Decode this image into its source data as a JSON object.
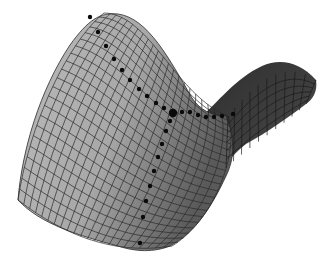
{
  "figure": {
    "colors": {
      "background": "#ffffff",
      "surface_front": "#b4b4b4",
      "surface_mid": "#9a9a9a",
      "surface_back": "#3a3a3a",
      "mesh_line": "#2a2a2a",
      "dots": "#0a0a0a"
    },
    "saddle_point": {
      "x": 173,
      "y": 113,
      "r": 4.2
    },
    "path_upper": [
      [
        90,
        17
      ],
      [
        98,
        32
      ],
      [
        106,
        46
      ],
      [
        114,
        59
      ],
      [
        122,
        70
      ],
      [
        130,
        80
      ],
      [
        139,
        89
      ],
      [
        147,
        96
      ],
      [
        156,
        103
      ],
      [
        164,
        108
      ]
    ],
    "path_right": [
      [
        182,
        112
      ],
      [
        190,
        112
      ],
      [
        198,
        115
      ],
      [
        206,
        117
      ],
      [
        214,
        117
      ],
      [
        222,
        116
      ],
      [
        233,
        114
      ]
    ],
    "path_lower": [
      [
        170,
        121
      ],
      [
        166,
        131
      ],
      [
        162,
        144
      ],
      [
        158,
        157
      ],
      [
        154,
        171
      ],
      [
        150,
        186
      ],
      [
        146,
        201
      ],
      [
        143,
        217
      ],
      [
        140,
        243
      ]
    ],
    "dot_radius": 2.2
  }
}
